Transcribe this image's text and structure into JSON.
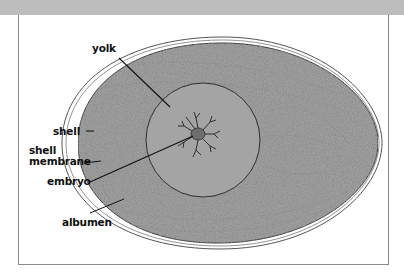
{
  "diagram": {
    "title": "",
    "labels": {
      "yolk": "yolk",
      "shell": "shell",
      "shell_membrane_line1": "shell",
      "shell_membrane_line2": "membrane",
      "embryo": "embryo",
      "albumen": "albumen"
    },
    "colors": {
      "top_band": "#bdbdbd",
      "frame_border": "#8a8a8a",
      "albumen_fill": "#9e9e9e",
      "yolk_fill": "#a4a4a4",
      "outline": "#333333",
      "shell_outline": "#555555",
      "label_text": "#111111"
    }
  }
}
